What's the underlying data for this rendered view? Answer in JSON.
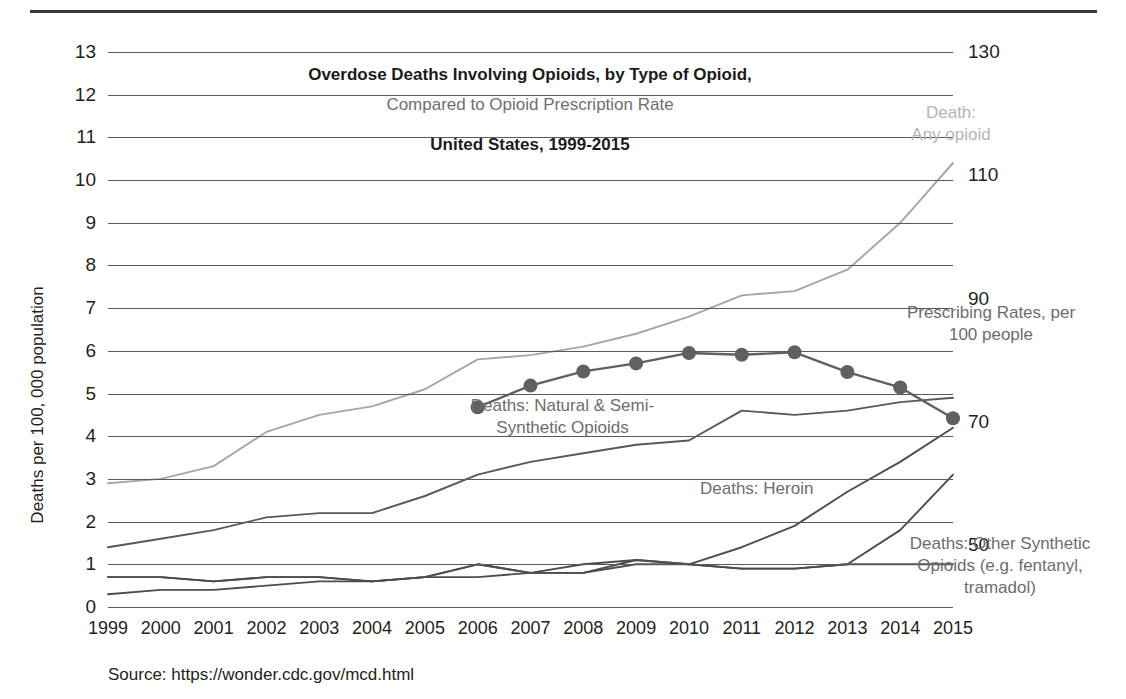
{
  "chart_data": {
    "type": "line",
    "title": "Overdose Deaths Involving Opioids, by Type of Opioid,",
    "subtitle": "Compared to Opioid Prescription Rate",
    "title_line3": "United States, 1999-2015",
    "xlabel": "",
    "ylabel": "Deaths per 100, 000 population",
    "ylabel_right": "",
    "source": "Source: https://wonder.cdc.gov/mcd.html",
    "grid": true,
    "legend_position": "inline-annotations",
    "categories": [
      "1999",
      "2000",
      "2001",
      "2002",
      "2003",
      "2004",
      "2005",
      "2006",
      "2007",
      "2008",
      "2009",
      "2010",
      "2011",
      "2012",
      "2013",
      "2014",
      "2015"
    ],
    "ylim": [
      0,
      13
    ],
    "yticks": [
      0,
      1,
      2,
      3,
      4,
      5,
      6,
      7,
      8,
      9,
      10,
      11,
      12,
      13
    ],
    "ylim_right": [
      40,
      130
    ],
    "yticks_right": [
      50,
      70,
      90,
      110,
      130
    ],
    "series": [
      {
        "name": "Death: Any opioid",
        "axis": "left",
        "color": "#a6a6a6",
        "values": [
          2.9,
          3.0,
          3.3,
          4.1,
          4.5,
          4.7,
          5.1,
          5.8,
          5.9,
          6.1,
          6.4,
          6.8,
          7.3,
          7.4,
          7.9,
          9.0,
          10.4
        ]
      },
      {
        "name": "Deaths: Natural & Semi-Synthetic Opioids",
        "axis": "left",
        "color": "#595959",
        "values": [
          1.4,
          1.6,
          1.8,
          2.1,
          2.2,
          2.2,
          2.6,
          3.1,
          3.4,
          3.6,
          3.8,
          3.9,
          4.6,
          4.5,
          4.6,
          4.8,
          4.9
        ]
      },
      {
        "name": "Deaths: Heroin",
        "axis": "left",
        "color": "#4d4d4d",
        "values": [
          0.7,
          0.7,
          0.6,
          0.7,
          0.7,
          0.6,
          0.7,
          1.0,
          0.8,
          0.8,
          1.1,
          1.0,
          0.9,
          0.9,
          1.0,
          1.0,
          1.0
        ]
      },
      {
        "name": "Deaths: Heroin (rise)",
        "axis": "left",
        "color": "#4d4d4d",
        "values": [
          0.7,
          0.7,
          0.6,
          0.7,
          0.7,
          0.6,
          0.7,
          0.7,
          0.8,
          1.0,
          1.1,
          1.0,
          1.4,
          1.9,
          2.7,
          3.4,
          4.2
        ]
      },
      {
        "name": "Deaths: Other Synthetic Opioids (e.g. fentanyl, tramadol)",
        "axis": "left",
        "color": "#4d4d4d",
        "values": [
          0.3,
          0.4,
          0.4,
          0.5,
          0.6,
          0.6,
          0.7,
          1.0,
          0.8,
          0.8,
          1.0,
          1.0,
          0.9,
          0.9,
          1.0,
          1.8,
          3.1
        ]
      },
      {
        "name": "Prescribing Rates, per 100 people",
        "axis": "right",
        "color": "#606060",
        "marker": "circle",
        "values": [
          null,
          null,
          null,
          null,
          null,
          null,
          null,
          72.4,
          75.9,
          78.2,
          79.5,
          81.2,
          80.9,
          81.3,
          78.1,
          75.6,
          70.6
        ]
      }
    ],
    "annotations": [
      {
        "text": "Death:\nAny opioid",
        "color": "#b5b5b5"
      },
      {
        "text": "Prescribing Rates, per\n100 people",
        "color": "#6d6d6d"
      },
      {
        "text": "Deaths: Natural & Semi-\nSynthetic Opioids",
        "color": "#6d6d6d"
      },
      {
        "text": "Deaths: Heroin",
        "color": "#6d6d6d"
      },
      {
        "text": "Deaths: Other Synthetic\nOpioids (e.g. fentanyl,\ntramadol)",
        "color": "#6d6d6d"
      }
    ]
  },
  "labels": {
    "any_opioid": "Death:\nAny opioid",
    "prescribing": "Prescribing Rates, per\n100 people",
    "natural": "Deaths: Natural & Semi-\nSynthetic Opioids",
    "heroin": "Deaths: Heroin",
    "other_synthetic": "Deaths: Other Synthetic\nOpioids (e.g. fentanyl,\ntramadol)"
  }
}
